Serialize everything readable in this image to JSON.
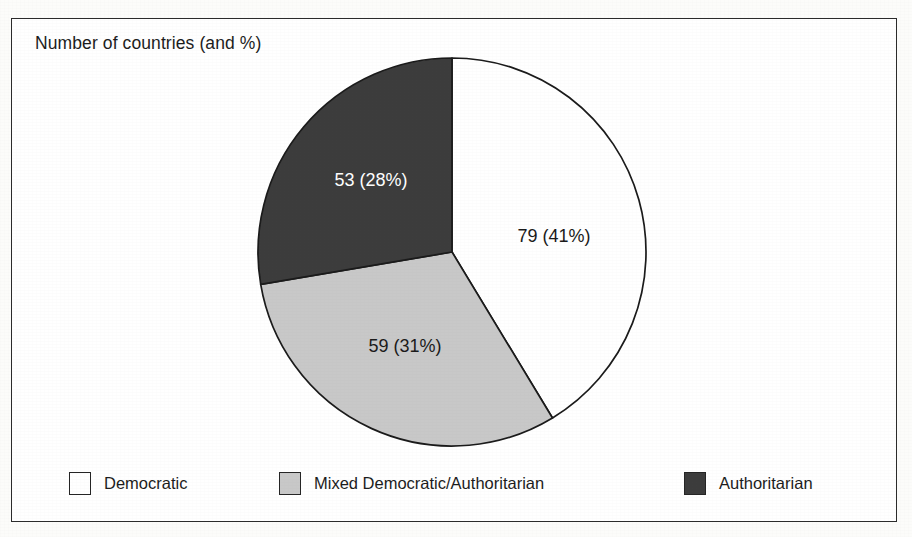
{
  "chart_data": {
    "type": "pie",
    "title": "Number of countries (and %)",
    "categories": [
      "Democratic",
      "Mixed Democratic/Authoritarian",
      "Authoritarian"
    ],
    "values": [
      79,
      59,
      53
    ],
    "percents": [
      41,
      31,
      28
    ],
    "total": 191,
    "labels": [
      "79 (41%)",
      "59 (31%)",
      "53 (28%)"
    ],
    "colors": [
      "#ffffff",
      "#c8c8c8",
      "#3c3c3c"
    ],
    "label_colors": [
      "#1a1a1a",
      "#1a1a1a",
      "#ffffff"
    ],
    "slice_border": "#1a1a1a",
    "start_angle_deg": 0,
    "direction": "clockwise",
    "legend_position": "bottom",
    "grid": false,
    "xlabel": "",
    "ylabel": ""
  },
  "figure": {
    "title": "Number of countries (and %)",
    "frame_color": "#2b2b2b",
    "background": "#ffffff"
  },
  "pie": {
    "center_x": 452,
    "center_y": 252,
    "radius": 194,
    "slices": [
      {
        "name": "Democratic",
        "value": 79,
        "percent": 41,
        "label": "79 (41%)",
        "color": "#ffffff",
        "label_color": "#1a1a1a",
        "label_x": 554,
        "label_y": 237,
        "start_deg": 0,
        "end_deg": 148.8
      },
      {
        "name": "Mixed Democratic/Authoritarian",
        "value": 59,
        "percent": 31,
        "label": "59 (31%)",
        "color": "#c8c8c8",
        "label_color": "#1a1a1a",
        "label_x": 405,
        "label_y": 347,
        "start_deg": 148.8,
        "end_deg": 260.4
      },
      {
        "name": "Authoritarian",
        "value": 53,
        "percent": 28,
        "label": "53 (28%)",
        "color": "#3c3c3c",
        "label_color": "#ffffff",
        "label_x": 371,
        "label_y": 181,
        "start_deg": 260.4,
        "end_deg": 360
      }
    ]
  },
  "legend": {
    "items": [
      {
        "label": "Democratic",
        "color": "#ffffff"
      },
      {
        "label": "Mixed Democratic/Authoritarian",
        "color": "#c8c8c8"
      },
      {
        "label": "Authoritarian",
        "color": "#3c3c3c"
      }
    ]
  }
}
